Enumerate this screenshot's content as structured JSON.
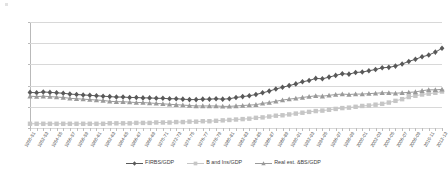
{
  "chart_data": {
    "type": "line",
    "title": "",
    "subtitle": "",
    "xlabel": "",
    "ylabel": "",
    "ylim": [
      0,
      25
    ],
    "yticks": [
      0,
      5,
      10,
      15,
      20,
      25
    ],
    "grid": true,
    "legend_position": "bottom-center",
    "categories": [
      "1950-51",
      "1951-52",
      "1952-53",
      "1953-54",
      "1954-55",
      "1955-56",
      "1956-57",
      "1957-58",
      "1958-59",
      "1959-60",
      "1960-61",
      "1961-62",
      "1962-63",
      "1963-64",
      "1964-65",
      "1965-66",
      "1966-67",
      "1967-68",
      "1968-69",
      "1969-70",
      "1970-71",
      "1971-72",
      "1972-73",
      "1973-74",
      "1974-75",
      "1975-76",
      "1976-77",
      "1977-78",
      "1978-79",
      "1979-80",
      "1980-81",
      "1981-82",
      "1982-83",
      "1983-84",
      "1984-85",
      "1985-86",
      "1986-87",
      "1987-88",
      "1988-89",
      "1989-90",
      "1990-91",
      "1991-92",
      "1992-93",
      "1993-94",
      "1994-95",
      "1995-96",
      "1996-97",
      "1997-98",
      "1998-99",
      "1999-00",
      "2000-01",
      "2001-02",
      "2002-03",
      "2003-04",
      "2004-05",
      "2005-06",
      "2006-07",
      "2007-08",
      "2008-09",
      "2009-10",
      "2010-11",
      "2011-12",
      "2012-13"
    ],
    "tick_labels_shown": [
      "1950-51",
      "1952-53",
      "1954-55",
      "1956-57",
      "1958-59",
      "1960-61",
      "1962-63",
      "1964-65",
      "1966-67",
      "1968-69",
      "1970-71",
      "1972-73",
      "1974-75",
      "1976-77",
      "1978-79",
      "1980-81",
      "1982-83",
      "1984-85",
      "1986-87",
      "1988-89",
      "1990-91",
      "1992-93",
      "1994-95",
      "1996-97",
      "1998-99",
      "2000-01",
      "2002-03",
      "2004-05",
      "2006-07",
      "2008-09",
      "2010-11",
      "2012-13"
    ],
    "series": [
      {
        "name": "FIRBS/GDP",
        "color": "#595959",
        "marker": "diamond",
        "values": [
          8.4,
          8.3,
          8.5,
          8.4,
          8.3,
          8.2,
          8.0,
          7.9,
          7.8,
          7.7,
          7.6,
          7.5,
          7.4,
          7.3,
          7.3,
          7.2,
          7.2,
          7.1,
          7.1,
          7.0,
          7.0,
          6.9,
          6.9,
          6.8,
          6.7,
          6.7,
          6.8,
          6.8,
          6.9,
          6.8,
          6.9,
          7.2,
          7.4,
          7.6,
          7.9,
          8.3,
          8.7,
          9.2,
          9.6,
          10.0,
          10.4,
          10.9,
          11.2,
          11.7,
          11.6,
          12.0,
          12.4,
          12.8,
          12.7,
          13.1,
          13.2,
          13.5,
          13.8,
          14.2,
          14.3,
          14.6,
          15.1,
          15.7,
          16.2,
          16.8,
          17.2,
          17.9,
          18.8
        ]
      },
      {
        "name": "B and Ins/GDP",
        "color": "#c6c6c6",
        "marker": "square",
        "values": [
          1.0,
          1.0,
          1.0,
          1.0,
          1.0,
          1.0,
          1.0,
          1.0,
          1.0,
          1.0,
          1.0,
          1.0,
          1.1,
          1.1,
          1.1,
          1.1,
          1.2,
          1.2,
          1.2,
          1.3,
          1.3,
          1.3,
          1.4,
          1.4,
          1.5,
          1.5,
          1.6,
          1.6,
          1.7,
          1.8,
          1.9,
          2.0,
          2.1,
          2.2,
          2.4,
          2.5,
          2.7,
          2.9,
          3.0,
          3.2,
          3.4,
          3.6,
          3.8,
          4.0,
          4.1,
          4.3,
          4.5,
          4.7,
          4.8,
          5.0,
          5.2,
          5.3,
          5.5,
          5.7,
          6.0,
          6.4,
          6.8,
          7.3,
          7.6,
          7.9,
          8.1,
          8.3,
          8.6
        ]
      },
      {
        "name": "Real est. &BS/GDP",
        "color": "#9a9a9a",
        "marker": "triangle",
        "values": [
          7.5,
          7.4,
          7.5,
          7.4,
          7.3,
          7.2,
          7.0,
          6.9,
          6.8,
          6.7,
          6.6,
          6.5,
          6.3,
          6.2,
          6.2,
          6.1,
          6.0,
          6.0,
          5.9,
          5.8,
          5.7,
          5.6,
          5.5,
          5.4,
          5.3,
          5.2,
          5.2,
          5.2,
          5.2,
          5.1,
          5.1,
          5.2,
          5.3,
          5.4,
          5.5,
          5.8,
          6.0,
          6.3,
          6.6,
          6.8,
          7.0,
          7.2,
          7.4,
          7.6,
          7.5,
          7.7,
          7.9,
          8.0,
          7.9,
          8.0,
          8.0,
          8.1,
          8.2,
          8.3,
          8.3,
          8.2,
          8.3,
          8.4,
          8.5,
          8.8,
          9.0,
          9.0,
          9.1
        ]
      }
    ]
  }
}
